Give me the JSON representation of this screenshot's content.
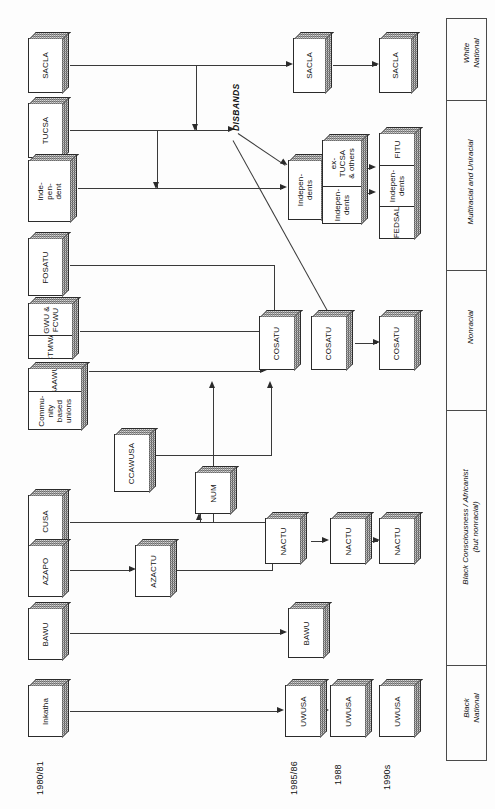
{
  "diagram": {
    "orientation": "rotated-90",
    "timeline": [
      {
        "id": "t1",
        "label": "1980/81"
      },
      {
        "id": "t2",
        "label": "1985/86"
      },
      {
        "id": "t3",
        "label": "1988"
      },
      {
        "id": "t4",
        "label": "1990s"
      }
    ],
    "categories": [
      {
        "id": "c-white",
        "label": "White\nNational"
      },
      {
        "id": "c-multi",
        "label": "Multiracial and Uniracial"
      },
      {
        "id": "c-non",
        "label": "Nonracial"
      },
      {
        "id": "c-bc",
        "label": "Black Consciousness / Africanist\n(but nonracial)"
      },
      {
        "id": "c-black",
        "label": "Black\nNational"
      }
    ],
    "annotations": [
      {
        "id": "a-disbands",
        "label": "DISBANDS"
      }
    ],
    "nodes": [
      {
        "id": "n-sacla-1",
        "column": "1980/81",
        "cells": [
          "SACLA"
        ]
      },
      {
        "id": "n-tucsa-1",
        "column": "1980/81",
        "cells": [
          "TUCSA"
        ]
      },
      {
        "id": "n-indep-1",
        "column": "1980/81",
        "cells": [
          "Inde-\npen-\ndent"
        ]
      },
      {
        "id": "n-fosatu-1",
        "column": "1980/81",
        "cells": [
          "FOSATU"
        ]
      },
      {
        "id": "n-gwu-1",
        "column": "1980/81",
        "cells": [
          "GWU &\nFCWU",
          "CTMWA"
        ]
      },
      {
        "id": "n-saawu-1",
        "column": "1980/81",
        "cells": [
          "SAAWU",
          "Commu-\nnity\nbased\nunions"
        ]
      },
      {
        "id": "n-ccawusa-1",
        "column": "1980/81",
        "cells": [
          "CCAWUSA"
        ]
      },
      {
        "id": "n-cusa-1",
        "column": "1980/81",
        "cells": [
          "CUSA"
        ]
      },
      {
        "id": "n-azapo-1",
        "column": "1980/81",
        "cells": [
          "AZAPO"
        ]
      },
      {
        "id": "n-bawu-1",
        "column": "1980/81",
        "cells": [
          "BAWU"
        ]
      },
      {
        "id": "n-inkatha-1",
        "column": "1980/81",
        "cells": [
          "Inkatha"
        ]
      },
      {
        "id": "n-azactu-2",
        "column": "1983",
        "cells": [
          "AZACTU"
        ]
      },
      {
        "id": "n-num-2",
        "column": "1983",
        "cells": [
          "NUM"
        ]
      },
      {
        "id": "n-sacla-2",
        "column": "1985/86",
        "cells": [
          "SACLA"
        ]
      },
      {
        "id": "n-indep-2",
        "column": "1985/86",
        "cells": [
          "Indepen-\ndents"
        ]
      },
      {
        "id": "n-extucsa-2",
        "column": "1985/86",
        "cells": [
          "ex-\nTUCSA\n& others",
          "Indepen-\ndents"
        ]
      },
      {
        "id": "n-cosatu-2",
        "column": "1985/86",
        "cells": [
          "COSATU"
        ]
      },
      {
        "id": "n-nactu-2",
        "column": "1985/86",
        "cells": [
          "NACTU"
        ]
      },
      {
        "id": "n-bawu-2",
        "column": "1985/86",
        "cells": [
          "BAWU"
        ]
      },
      {
        "id": "n-uwusa-2",
        "column": "1985/86",
        "cells": [
          "UWUSA"
        ]
      },
      {
        "id": "n-cosatu-3",
        "column": "1988",
        "cells": [
          "COSATU"
        ]
      },
      {
        "id": "n-nactu-3",
        "column": "1988",
        "cells": [
          "NACTU"
        ]
      },
      {
        "id": "n-uwusa-3",
        "column": "1988",
        "cells": [
          "UWUSA"
        ]
      },
      {
        "id": "n-sacla-4",
        "column": "1990s",
        "cells": [
          "SACLA"
        ]
      },
      {
        "id": "n-fitu-4",
        "column": "1990s",
        "cells": [
          "FITU",
          "Indepen-\ndents",
          "FEDSAL"
        ]
      },
      {
        "id": "n-cosatu-4",
        "column": "1990s",
        "cells": [
          "COSATU"
        ]
      },
      {
        "id": "n-nactu-4",
        "column": "1990s",
        "cells": [
          "NACTU"
        ]
      },
      {
        "id": "n-uwusa-4",
        "column": "1990s",
        "cells": [
          "UWUSA"
        ]
      }
    ],
    "edges": [
      {
        "from": "n-sacla-1",
        "to": "n-sacla-2"
      },
      {
        "from": "n-sacla-2",
        "to": "n-sacla-4"
      },
      {
        "from": "n-tucsa-1",
        "to": "a-disbands"
      },
      {
        "from": "a-disbands",
        "to": "n-indep-2"
      },
      {
        "from": "a-disbands",
        "to": "n-cosatu-3"
      },
      {
        "from": "n-indep-1",
        "to": "n-indep-2"
      },
      {
        "from": "n-extucsa-2",
        "to": "n-fitu-4"
      },
      {
        "from": "n-fosatu-1",
        "to": "n-cosatu-2"
      },
      {
        "from": "n-gwu-1",
        "to": "n-cosatu-2"
      },
      {
        "from": "n-saawu-1",
        "to": "n-cosatu-2"
      },
      {
        "from": "n-ccawusa-1",
        "to": "n-cosatu-2"
      },
      {
        "from": "n-num-2",
        "to": "n-cosatu-2"
      },
      {
        "from": "n-cosatu-2",
        "to": "n-cosatu-3"
      },
      {
        "from": "n-cosatu-3",
        "to": "n-cosatu-4"
      },
      {
        "from": "n-cusa-1",
        "to": "n-nactu-2"
      },
      {
        "from": "n-cusa-1",
        "to": "n-num-2"
      },
      {
        "from": "n-azapo-1",
        "to": "n-azactu-2"
      },
      {
        "from": "n-azactu-2",
        "to": "n-nactu-2"
      },
      {
        "from": "n-nactu-2",
        "to": "n-nactu-3"
      },
      {
        "from": "n-nactu-3",
        "to": "n-nactu-4"
      },
      {
        "from": "n-bawu-1",
        "to": "n-bawu-2"
      },
      {
        "from": "n-inkatha-1",
        "to": "n-uwusa-2"
      },
      {
        "from": "n-uwusa-2",
        "to": "n-uwusa-3"
      }
    ]
  }
}
